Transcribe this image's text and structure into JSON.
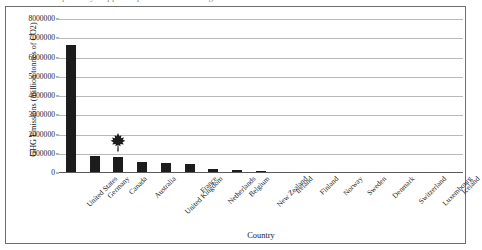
{
  "caption": {
    "clipped_text": "partially clipped caption line above figure"
  },
  "chart_data": {
    "type": "bar",
    "title": "",
    "xlabel": "Country",
    "ylabel": "GHG Emissions (million tonnes of CO2)",
    "ylim": [
      0,
      8000000
    ],
    "ytick_labels": [
      "8000000",
      "7000000",
      "6000000",
      "5000000",
      "4000000",
      "3000000",
      "2000000",
      "1000000",
      "0"
    ],
    "ytick_values": [
      8000000,
      7000000,
      6000000,
      5000000,
      4000000,
      3000000,
      2000000,
      1000000,
      0
    ],
    "grid": true,
    "legend": "none",
    "bar_color": "#1c1c1c",
    "gridline_color": "#b9b9b9",
    "categories": [
      "United States",
      "Germany",
      "Canada",
      "Australia",
      "United Kingdom",
      "France",
      "Netherlands",
      "Belgium",
      "New Zealand",
      "Ireland",
      "Finland",
      "Norway",
      "Sweden",
      "Denmark",
      "Switzerland",
      "Luxembourg",
      "Iceland"
    ],
    "values": [
      6650000,
      860000,
      820000,
      560000,
      510000,
      470000,
      210000,
      140000,
      80000,
      68000,
      60000,
      53000,
      50000,
      48000,
      45000,
      40000,
      15000
    ],
    "annotations": [
      {
        "name": "maple-leaf-marker",
        "category": "Canada",
        "icon": "maple-leaf-icon",
        "color": "#1c1c1c"
      }
    ]
  }
}
